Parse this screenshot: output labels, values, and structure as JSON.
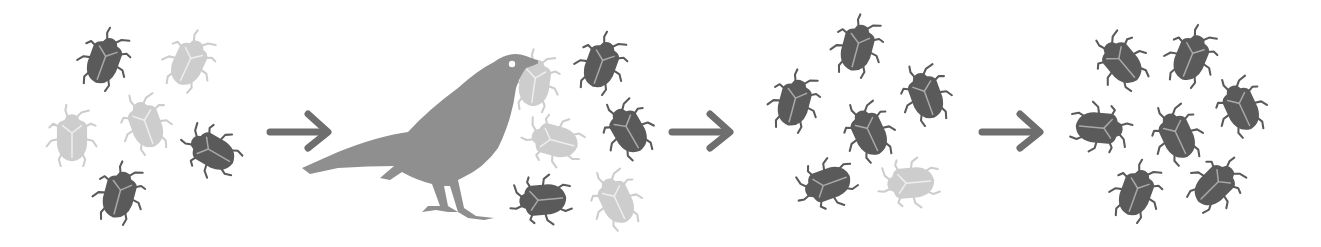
{
  "colors": {
    "background": "#ffffff",
    "dark_bug": "#5a5a5a",
    "light_bug": "#cdcdcd",
    "bird": "#8f8f8f",
    "arrow": "#6e6e6e",
    "dark_bug_marking": "#a9a9a9",
    "light_bug_marking": "#eeeeee"
  },
  "figure": {
    "stages": [
      {
        "id": "initial-population",
        "bugs": [
          {
            "color": "dark",
            "x": 105,
            "y": 58,
            "rot": 20
          },
          {
            "color": "light",
            "x": 190,
            "y": 60,
            "rot": 25
          },
          {
            "color": "light",
            "x": 72,
            "y": 135,
            "rot": 0
          },
          {
            "color": "light",
            "x": 145,
            "y": 122,
            "rot": -20
          },
          {
            "color": "dark",
            "x": 210,
            "y": 150,
            "rot": -60
          },
          {
            "color": "dark",
            "x": 120,
            "y": 192,
            "rot": 15
          }
        ]
      },
      {
        "id": "predation",
        "bird": {
          "present": true,
          "holding_bug": "light"
        },
        "bugs": [
          {
            "color": "light",
            "x": 535,
            "y": 80,
            "rot": 8
          },
          {
            "color": "dark",
            "x": 602,
            "y": 62,
            "rot": 20
          },
          {
            "color": "light",
            "x": 552,
            "y": 140,
            "rot": -75
          },
          {
            "color": "dark",
            "x": 627,
            "y": 128,
            "rot": -30
          },
          {
            "color": "dark",
            "x": 540,
            "y": 200,
            "rot": -95
          },
          {
            "color": "light",
            "x": 615,
            "y": 198,
            "rot": -25
          }
        ]
      },
      {
        "id": "survivors",
        "bugs": [
          {
            "color": "dark",
            "x": 858,
            "y": 45,
            "rot": 15
          },
          {
            "color": "dark",
            "x": 795,
            "y": 100,
            "rot": 15
          },
          {
            "color": "dark",
            "x": 925,
            "y": 93,
            "rot": -20
          },
          {
            "color": "dark",
            "x": 868,
            "y": 130,
            "rot": -25
          },
          {
            "color": "dark",
            "x": 825,
            "y": 185,
            "rot": -110
          },
          {
            "color": "light",
            "x": 908,
            "y": 183,
            "rot": -95
          }
        ]
      },
      {
        "id": "next-generation",
        "bugs": [
          {
            "color": "dark",
            "x": 1120,
            "y": 60,
            "rot": -40
          },
          {
            "color": "dark",
            "x": 1192,
            "y": 55,
            "rot": 22
          },
          {
            "color": "dark",
            "x": 1240,
            "y": 105,
            "rot": -25
          },
          {
            "color": "dark",
            "x": 1102,
            "y": 128,
            "rot": 95
          },
          {
            "color": "dark",
            "x": 1176,
            "y": 133,
            "rot": -25
          },
          {
            "color": "dark",
            "x": 1137,
            "y": 190,
            "rot": 20
          },
          {
            "color": "dark",
            "x": 1217,
            "y": 183,
            "rot": 45
          }
        ]
      }
    ],
    "arrows": [
      {
        "id": "arrow-1",
        "x": 266,
        "y": 108
      },
      {
        "id": "arrow-2",
        "x": 668,
        "y": 108
      },
      {
        "id": "arrow-3",
        "x": 978,
        "y": 108
      }
    ]
  }
}
